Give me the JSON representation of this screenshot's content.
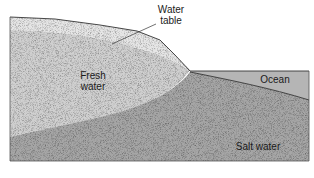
{
  "diagram": {
    "labels": {
      "water_table_line1": "Water",
      "water_table_line2": "table",
      "fresh_line1": "Fresh",
      "fresh_line2": "water",
      "ocean": "Ocean",
      "salt_water": "Salt water"
    },
    "colors": {
      "unsaturated_zone": "#e6e6e6",
      "fresh_water": "#d2d2d2",
      "salt_water": "#a9a9a9",
      "ocean": "#b4b4b4",
      "outline": "#333333"
    }
  }
}
